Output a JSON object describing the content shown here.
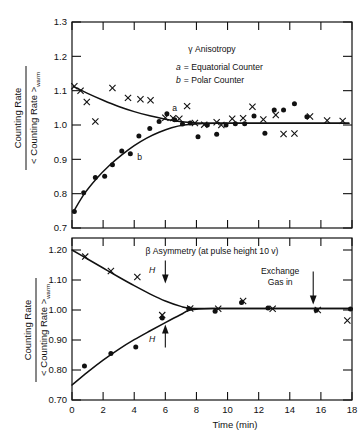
{
  "figure": {
    "caption_hidden": "",
    "axis_y_numerator": "Counting Rate",
    "axis_y_denominator_prefix": "< Counting Rate >",
    "axis_y_denominator_sub": "warm",
    "axis_x_label": "Time  (min)"
  },
  "chart_data": [
    {
      "type": "scatter",
      "panel": "top",
      "title": "γ Anisotropy",
      "legend": [
        {
          "key": "a",
          "label": "= Equatorial Counter"
        },
        {
          "key": "b",
          "label": "= Polar Counter"
        }
      ],
      "xlabel": "",
      "ylabel": "Counting Rate / < Counting Rate >warm",
      "xlim": [
        0,
        18
      ],
      "ylim": [
        0.7,
        1.3
      ],
      "xticks": [
        0,
        2,
        4,
        6,
        8,
        10,
        12,
        14,
        16,
        18
      ],
      "xticklabels": [
        "",
        "",
        "",
        "",
        "",
        "",
        "",
        "",
        "",
        ""
      ],
      "yticks": [
        0.7,
        0.8,
        0.9,
        1.0,
        1.1,
        1.2,
        1.3
      ],
      "yticklabels": [
        "0.7",
        "0.8",
        "0.9",
        "1.0",
        "1.1",
        "1.2",
        "1.3"
      ],
      "grid": false,
      "series": [
        {
          "name": "a",
          "marker": "x",
          "label": "a",
          "label_x": 6.6,
          "label_y": 1.042,
          "x": [
            0.15,
            0.55,
            0.95,
            1.5,
            2.6,
            3.6,
            4.4,
            5.05,
            6.0,
            6.5,
            6.9,
            7.4,
            7.9,
            8.5,
            9.3,
            9.6,
            10.3,
            11.0,
            11.6,
            12.3,
            13.1,
            13.6,
            14.3,
            15.3,
            16.4,
            17.4
          ],
          "y": [
            1.113,
            1.1,
            1.067,
            1.01,
            1.108,
            1.079,
            1.075,
            1.072,
            1.021,
            1.02,
            1.018,
            1.055,
            1.006,
            1.001,
            1.008,
            1.0,
            1.018,
            1.02,
            1.053,
            1.016,
            1.029,
            0.974,
            0.975,
            1.025,
            1.013,
            1.012
          ]
        },
        {
          "name": "b",
          "marker": "o",
          "label": "b",
          "label_x": 4.35,
          "label_y": 0.897,
          "x": [
            0.15,
            0.75,
            1.5,
            2.1,
            2.6,
            3.2,
            3.75,
            4.3,
            5.0,
            5.6,
            6.1,
            6.6,
            7.1,
            7.6,
            8.1,
            8.7,
            9.3,
            9.9,
            10.5,
            11.1,
            11.7,
            12.4,
            13.0,
            13.6,
            14.3,
            15.1
          ],
          "y": [
            0.748,
            0.803,
            0.847,
            0.851,
            0.884,
            0.924,
            0.916,
            0.968,
            0.99,
            1.01,
            1.033,
            1.015,
            1.003,
            1.006,
            0.966,
            1.0,
            0.973,
            1.0,
            1.004,
            1.004,
            1.026,
            0.976,
            1.044,
            1.044,
            1.062,
            1.024
          ]
        }
      ],
      "fit_curves": [
        {
          "name": "a-fit",
          "points_x": [
            0.1,
            1.0,
            2.0,
            3.0,
            4.0,
            5.0,
            6.0,
            6.8,
            7.6,
            8.6,
            10.0,
            12.0,
            14.0,
            16.0,
            17.8
          ],
          "points_y": [
            1.112,
            1.092,
            1.072,
            1.054,
            1.039,
            1.027,
            1.017,
            1.011,
            1.007,
            1.005,
            1.005,
            1.005,
            1.005,
            1.005,
            1.005
          ]
        },
        {
          "name": "b-fit",
          "points_x": [
            0.1,
            0.8,
            1.6,
            2.4,
            3.2,
            4.0,
            4.8,
            5.6,
            6.4,
            7.2,
            8.2,
            9.5,
            11.0,
            13.0,
            15.0,
            17.8
          ],
          "points_y": [
            0.748,
            0.8,
            0.845,
            0.882,
            0.913,
            0.94,
            0.962,
            0.979,
            0.992,
            1.0,
            1.004,
            1.005,
            1.005,
            1.005,
            1.005,
            1.005
          ]
        }
      ]
    },
    {
      "type": "scatter",
      "panel": "bottom",
      "title": "β Asymmetry  (at pulse height  10 v)",
      "xlabel": "Time  (min)",
      "ylabel": "Counting Rate / < Counting Rate >warm",
      "xlim": [
        0,
        18
      ],
      "ylim": [
        0.7,
        1.24
      ],
      "xticks": [
        0,
        2,
        4,
        6,
        8,
        10,
        12,
        14,
        16,
        18
      ],
      "xticklabels": [
        "0",
        "2",
        "4",
        "6",
        "8",
        "10",
        "12",
        "14",
        "16",
        "18"
      ],
      "yticks": [
        0.7,
        0.8,
        0.9,
        1.0,
        1.1,
        1.2
      ],
      "yticklabels": [
        "0.70",
        "0.80",
        "0.90",
        "1.00",
        "1.10",
        "1.20"
      ],
      "grid": false,
      "annotations": [
        {
          "name": "field-down",
          "text": "H",
          "arrow": "down",
          "x": 6.0,
          "y": 1.135
        },
        {
          "name": "field-up",
          "text": "H",
          "arrow": "up",
          "x": 6.0,
          "y": 0.905
        },
        {
          "name": "exchange-gas",
          "text_line1": "Exchange",
          "text_line2": "Gas in",
          "arrow": "down",
          "x": 14.8,
          "y": 1.075
        }
      ],
      "series": [
        {
          "name": "H-down",
          "marker": "x",
          "x": [
            0.85,
            2.5,
            4.2,
            5.8,
            7.6,
            9.4,
            11.0,
            12.9,
            15.8,
            17.7
          ],
          "y": [
            1.178,
            1.13,
            1.11,
            0.983,
            1.005,
            1.004,
            1.03,
            1.004,
            1.0,
            0.965
          ]
        },
        {
          "name": "H-up",
          "marker": "o",
          "x": [
            0.8,
            2.5,
            4.1,
            5.8,
            7.5,
            9.2,
            10.9,
            12.6,
            15.7,
            17.9
          ],
          "y": [
            0.813,
            0.855,
            0.877,
            0.973,
            1.005,
            0.996,
            1.025,
            1.007,
            0.999,
            1.003
          ]
        }
      ],
      "fit_curves": [
        {
          "name": "H-down-fit",
          "points_x": [
            0.0,
            1.0,
            2.0,
            3.0,
            4.0,
            5.0,
            6.0,
            7.0,
            7.6,
            9.0,
            11.0,
            13.0,
            15.0,
            17.0,
            18.0
          ],
          "points_y": [
            1.2,
            1.17,
            1.14,
            1.11,
            1.081,
            1.054,
            1.03,
            1.012,
            1.006,
            1.005,
            1.005,
            1.005,
            1.005,
            1.005,
            1.005
          ]
        },
        {
          "name": "H-up-fit",
          "points_x": [
            0.0,
            1.0,
            2.0,
            3.0,
            4.0,
            5.0,
            6.0,
            7.0,
            7.6,
            9.0,
            11.0,
            13.0,
            15.0,
            17.0,
            18.0
          ],
          "points_y": [
            0.75,
            0.793,
            0.833,
            0.869,
            0.901,
            0.93,
            0.958,
            0.985,
            1.0,
            1.005,
            1.005,
            1.005,
            1.005,
            1.005,
            1.005
          ]
        }
      ]
    }
  ]
}
